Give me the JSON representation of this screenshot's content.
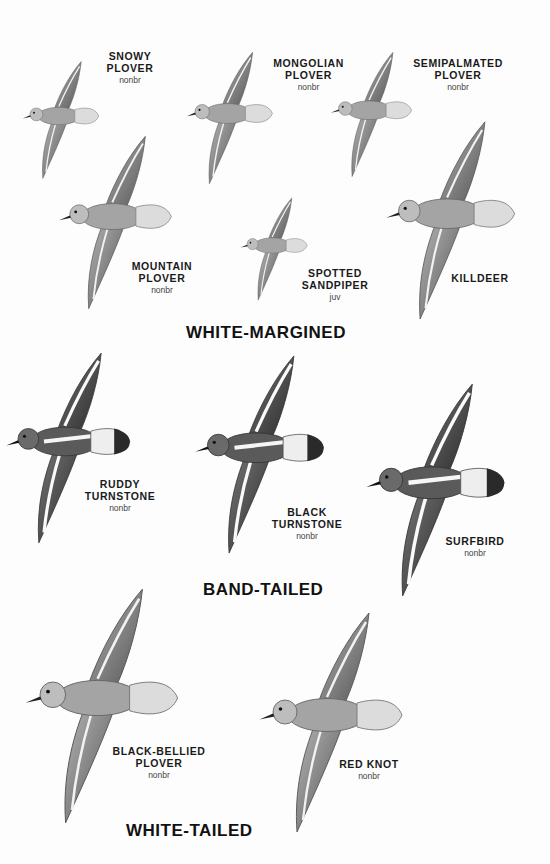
{
  "plate": {
    "groups": [
      {
        "heading": "WHITE-MARGINED"
      },
      {
        "heading": "BAND-TAILED"
      },
      {
        "heading": "WHITE-TAILED"
      }
    ],
    "birds": [
      {
        "name": "SNOWY\nPLOVER",
        "plumage": "nonbr"
      },
      {
        "name": "MONGOLIAN\nPLOVER",
        "plumage": "nonbr"
      },
      {
        "name": "SEMIPALMATED\nPLOVER",
        "plumage": "nonbr"
      },
      {
        "name": "MOUNTAIN\nPLOVER",
        "plumage": "nonbr"
      },
      {
        "name": "SPOTTED\nSANDPIPER",
        "plumage": "juv"
      },
      {
        "name": "KILLDEER",
        "plumage": ""
      },
      {
        "name": "RUDDY\nTURNSTONE",
        "plumage": "nonbr"
      },
      {
        "name": "BLACK\nTURNSTONE",
        "plumage": "nonbr"
      },
      {
        "name": "SURFBIRD",
        "plumage": "nonbr"
      },
      {
        "name": "BLACK-BELLIED\nPLOVER",
        "plumage": "nonbr"
      },
      {
        "name": "RED KNOT",
        "plumage": "nonbr"
      }
    ]
  },
  "colors": {
    "background": "#fdfdfd",
    "text": "#1a1a1a",
    "bird_body": "#9a9a9a",
    "bird_dark": "#4a4a4a",
    "bird_light": "#e6e6e6"
  }
}
